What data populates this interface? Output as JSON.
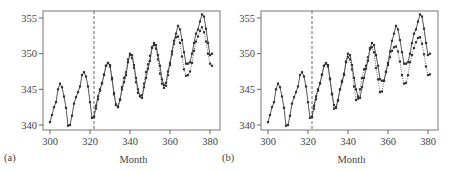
{
  "chart_data": [
    {
      "type": "line",
      "panel_label": "(a)",
      "xlabel": "Month",
      "ylabel": "",
      "xlim": [
        297,
        385
      ],
      "ylim": [
        339.3,
        356.0
      ],
      "xticks": [
        300,
        320,
        340,
        360,
        380
      ],
      "yticks": [
        340,
        345,
        350,
        355
      ],
      "grid": false,
      "legend": "none",
      "cutoff_month": 322,
      "series": [
        {
          "name": "Observed",
          "style": "solid",
          "x": [
            300,
            301,
            302,
            303,
            304,
            305,
            306,
            307,
            308,
            309,
            310,
            311,
            312,
            313,
            314,
            315,
            316,
            317,
            318,
            319,
            320,
            321,
            322,
            323,
            324,
            325,
            326,
            327,
            328,
            329,
            330,
            331,
            332,
            333,
            334,
            335,
            336,
            337,
            338,
            339,
            340,
            341,
            342,
            343,
            344,
            345,
            346,
            347,
            348,
            349,
            350,
            351,
            352,
            353,
            354,
            355,
            356,
            357,
            358,
            359,
            360,
            361,
            362,
            363,
            364,
            365,
            366,
            367,
            368,
            369,
            370,
            371,
            372,
            373,
            374,
            375,
            376,
            377,
            378,
            379,
            380,
            381
          ],
          "values": [
            340.4,
            341.4,
            342.5,
            343.2,
            345.0,
            345.8,
            345.3,
            344.0,
            342.4,
            339.9,
            340.0,
            341.3,
            343.0,
            343.9,
            344.6,
            345.4,
            347.0,
            347.4,
            346.8,
            345.4,
            343.2,
            341.0,
            341.1,
            342.7,
            344.0,
            345.0,
            345.8,
            347.0,
            348.3,
            348.7,
            348.4,
            346.4,
            344.3,
            342.8,
            342.5,
            343.5,
            345.0,
            346.0,
            347.0,
            348.8,
            350.0,
            349.8,
            348.4,
            346.6,
            345.0,
            344.0,
            343.8,
            345.3,
            346.6,
            347.9,
            349.0,
            350.8,
            351.5,
            351.2,
            349.8,
            348.3,
            346.4,
            345.6,
            345.9,
            347.5,
            348.7,
            350.3,
            351.8,
            352.8,
            353.9,
            353.4,
            351.9,
            350.2,
            348.6,
            348.6,
            348.8,
            350.0,
            351.5,
            352.8,
            353.4,
            354.5,
            355.5,
            355.2,
            353.5,
            351.5,
            349.8,
            350.0
          ]
        },
        {
          "name": "Forecast",
          "style": "dotted",
          "x": [
            322,
            323,
            324,
            325,
            326,
            327,
            328,
            329,
            330,
            331,
            332,
            333,
            334,
            335,
            336,
            337,
            338,
            339,
            340,
            341,
            342,
            343,
            344,
            345,
            346,
            347,
            348,
            349,
            350,
            351,
            352,
            353,
            354,
            355,
            356,
            357,
            358,
            359,
            360,
            361,
            362,
            363,
            364,
            365,
            366,
            367,
            368,
            369,
            370,
            371,
            372,
            373,
            374,
            375,
            376,
            377,
            378,
            379,
            380,
            381
          ],
          "values": [
            341.2,
            342.3,
            343.6,
            344.8,
            345.9,
            347.1,
            348.3,
            348.7,
            348.2,
            346.6,
            344.5,
            342.9,
            342.6,
            343.6,
            345.3,
            346.6,
            347.4,
            349.2,
            349.8,
            349.4,
            348.0,
            346.0,
            344.5,
            344.1,
            344.2,
            345.8,
            347.4,
            348.5,
            349.7,
            350.9,
            351.2,
            350.7,
            349.2,
            347.2,
            345.8,
            345.2,
            345.5,
            347.0,
            348.4,
            349.9,
            351.4,
            352.3,
            352.4,
            351.5,
            349.6,
            347.8,
            346.9,
            347.0,
            347.5,
            348.7,
            350.4,
            351.7,
            352.4,
            353.2,
            353.7,
            353.0,
            351.7,
            350.0,
            348.6,
            348.3
          ]
        }
      ]
    },
    {
      "type": "line",
      "panel_label": "(b)",
      "xlabel": "Month",
      "ylabel": "",
      "xlim": [
        297,
        385
      ],
      "ylim": [
        339.3,
        356.0
      ],
      "xticks": [
        300,
        320,
        340,
        360,
        380
      ],
      "yticks": [
        340,
        345,
        350,
        355
      ],
      "grid": false,
      "legend": "none",
      "cutoff_month": 322,
      "series": [
        {
          "name": "Observed",
          "style": "solid",
          "x": [
            300,
            301,
            302,
            303,
            304,
            305,
            306,
            307,
            308,
            309,
            310,
            311,
            312,
            313,
            314,
            315,
            316,
            317,
            318,
            319,
            320,
            321,
            322,
            323,
            324,
            325,
            326,
            327,
            328,
            329,
            330,
            331,
            332,
            333,
            334,
            335,
            336,
            337,
            338,
            339,
            340,
            341,
            342,
            343,
            344,
            345,
            346,
            347,
            348,
            349,
            350,
            351,
            352,
            353,
            354,
            355,
            356,
            357,
            358,
            359,
            360,
            361,
            362,
            363,
            364,
            365,
            366,
            367,
            368,
            369,
            370,
            371,
            372,
            373,
            374,
            375,
            376,
            377,
            378,
            379,
            380,
            381
          ],
          "values": [
            340.4,
            341.4,
            342.5,
            343.2,
            345.0,
            345.8,
            345.3,
            344.0,
            342.4,
            339.9,
            340.0,
            341.3,
            343.0,
            343.9,
            344.6,
            345.4,
            347.0,
            347.4,
            346.8,
            345.4,
            343.2,
            341.0,
            341.1,
            342.7,
            344.0,
            345.0,
            345.8,
            347.0,
            348.3,
            348.7,
            348.4,
            346.4,
            344.3,
            342.8,
            342.5,
            343.5,
            345.0,
            346.0,
            347.0,
            348.8,
            350.0,
            349.8,
            348.4,
            346.6,
            345.0,
            344.0,
            343.8,
            345.3,
            346.6,
            347.9,
            349.0,
            350.8,
            351.5,
            351.2,
            349.8,
            348.3,
            346.4,
            346.2,
            346.2,
            347.5,
            348.7,
            350.3,
            351.8,
            352.8,
            353.9,
            353.4,
            351.9,
            350.2,
            348.6,
            348.6,
            348.8,
            350.0,
            351.5,
            352.8,
            353.4,
            354.5,
            355.5,
            355.2,
            353.5,
            351.5,
            349.8,
            350.0
          ]
        },
        {
          "name": "Forecast",
          "style": "dotted",
          "x": [
            322,
            323,
            324,
            325,
            326,
            327,
            328,
            329,
            330,
            331,
            332,
            333,
            334,
            335,
            336,
            337,
            338,
            339,
            340,
            341,
            342,
            343,
            344,
            345,
            346,
            347,
            348,
            349,
            350,
            351,
            352,
            353,
            354,
            355,
            356,
            357,
            358,
            359,
            360,
            361,
            362,
            363,
            364,
            365,
            366,
            367,
            368,
            369,
            370,
            371,
            372,
            373,
            374,
            375,
            376,
            377,
            378,
            379,
            380,
            381
          ],
          "values": [
            341.2,
            342.3,
            343.6,
            344.8,
            345.9,
            347.1,
            348.3,
            348.6,
            348.2,
            346.5,
            344.4,
            342.3,
            342.4,
            343.4,
            345.0,
            346.2,
            347.2,
            348.9,
            349.5,
            349.2,
            347.8,
            345.4,
            343.5,
            343.7,
            345.0,
            346.6,
            347.8,
            348.3,
            349.5,
            350.6,
            350.9,
            350.2,
            348.0,
            346.4,
            344.6,
            344.7,
            346.2,
            347.4,
            348.4,
            349.5,
            350.4,
            350.9,
            351.0,
            350.3,
            348.9,
            347.0,
            345.8,
            345.9,
            347.0,
            348.8,
            349.8,
            350.8,
            351.6,
            352.2,
            352.3,
            351.4,
            349.9,
            348.2,
            347.0,
            347.1
          ]
        }
      ]
    }
  ]
}
